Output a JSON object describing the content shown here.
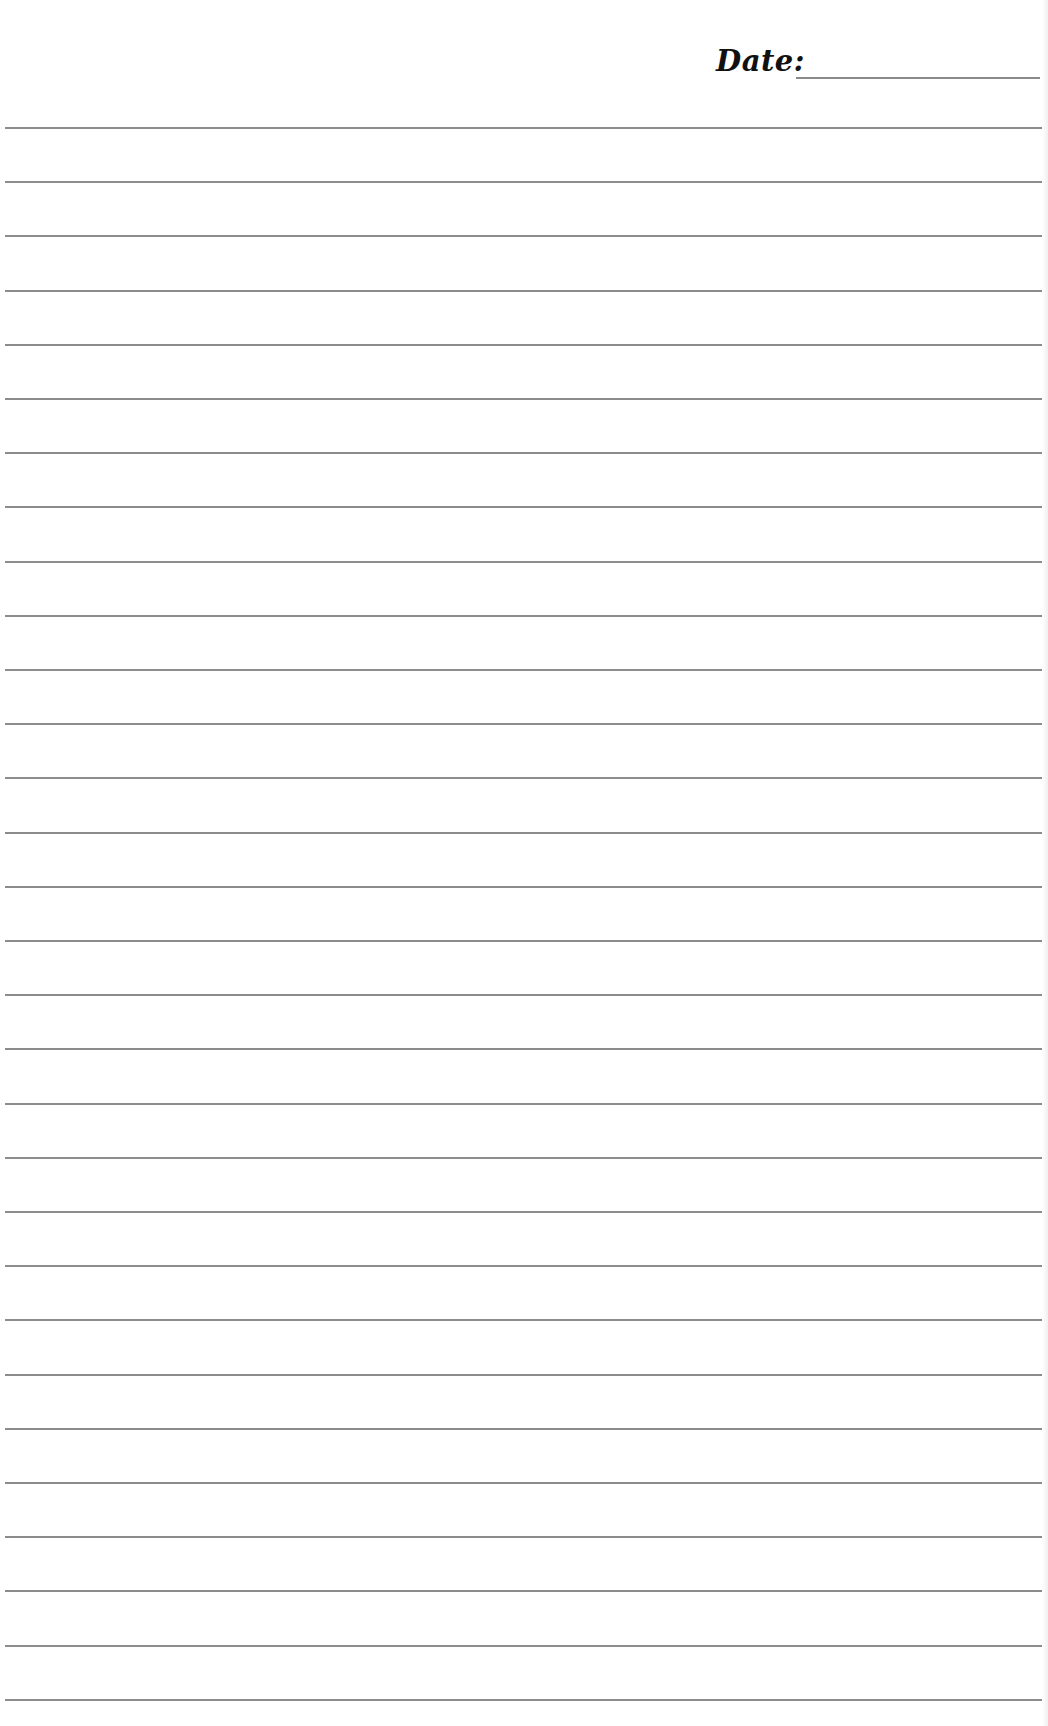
{
  "header": {
    "date_label": "Date:",
    "date_value": ""
  },
  "page": {
    "line_count": 30,
    "first_line_y": 127,
    "line_spacing": 54.2,
    "line_color": "#8c8c8c",
    "background": "#ffffff"
  }
}
